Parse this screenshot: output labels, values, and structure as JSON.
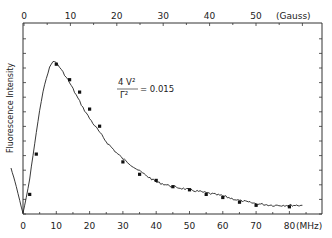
{
  "chart_data": {
    "type": "line",
    "title": "",
    "xlabel": "(MHz)",
    "x2label": "(Gauss)",
    "ylabel": "Fluorescence Intensity",
    "xlim": [
      -4,
      86
    ],
    "x2_ticks": [
      0,
      10,
      20,
      30,
      40,
      50
    ],
    "x_ticks": [
      0,
      10,
      20,
      30,
      40,
      50,
      60,
      70,
      80
    ],
    "grid": false,
    "legend": null,
    "annotation": {
      "numerator": "4 V²",
      "denominator": "Γ²",
      "value": "= 0.015"
    },
    "series": [
      {
        "name": "measured signal (line)",
        "x": [
          -3.6,
          -2,
          -1,
          0,
          1,
          2,
          3,
          4,
          5,
          6,
          7,
          8,
          9,
          10,
          12,
          14,
          16,
          18,
          20,
          22,
          25,
          28,
          30,
          35,
          40,
          45,
          50,
          55,
          60,
          65,
          70,
          75,
          80,
          83.9
        ],
        "y": [
          0.29,
          0.17,
          0.08,
          0.0,
          0.1,
          0.22,
          0.37,
          0.52,
          0.66,
          0.78,
          0.87,
          0.94,
          0.98,
          0.97,
          0.91,
          0.84,
          0.76,
          0.68,
          0.61,
          0.55,
          0.46,
          0.39,
          0.35,
          0.27,
          0.2,
          0.17,
          0.15,
          0.13,
          0.11,
          0.08,
          0.06,
          0.05,
          0.05,
          0.05
        ]
      },
      {
        "name": "calculated points (dots)",
        "x": [
          2,
          4,
          10,
          14,
          17,
          20,
          23,
          30,
          35,
          40,
          45,
          50,
          55,
          60,
          65,
          70,
          80
        ],
        "y": [
          0.12,
          0.38,
          0.96,
          0.86,
          0.78,
          0.67,
          0.56,
          0.33,
          0.25,
          0.21,
          0.17,
          0.15,
          0.12,
          0.1,
          0.07,
          0.05,
          0.04
        ]
      }
    ]
  }
}
